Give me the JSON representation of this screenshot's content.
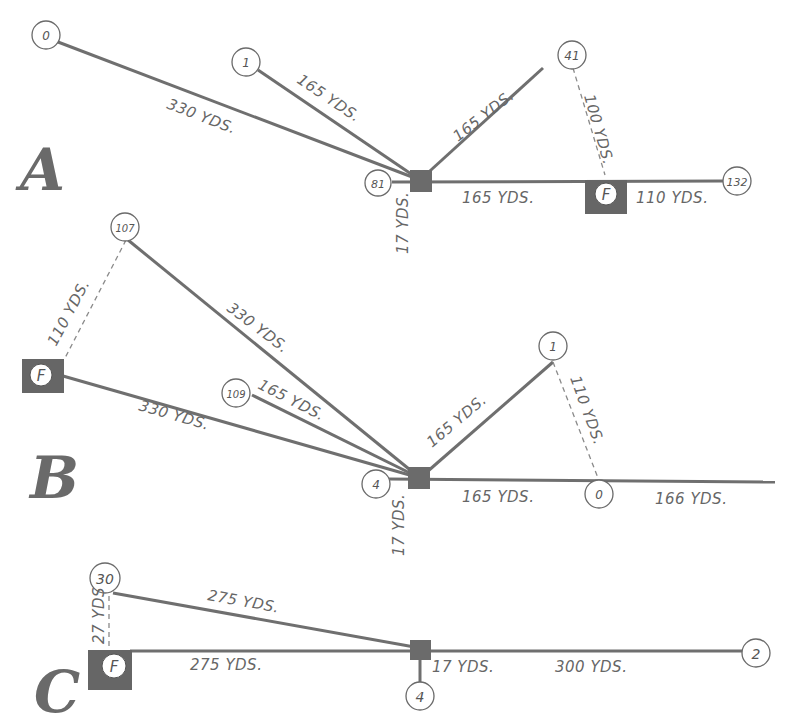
{
  "diagrams": [
    {
      "letter": "A",
      "nodes": {
        "n0": "0",
        "n1": "1",
        "n41": "41",
        "n81": "81",
        "n132": "132",
        "fire": "F"
      },
      "labels": {
        "l330": "330 YDS.",
        "l165a": "165 YDS.",
        "l165b": "165 YDS.",
        "l100": "100 YDS.",
        "l165c": "165 YDS.",
        "l110": "110 YDS.",
        "l17": "17 YDS."
      }
    },
    {
      "letter": "B",
      "nodes": {
        "n107": "107",
        "n109": "109",
        "n1": "1",
        "n4": "4",
        "n0": "0",
        "fire": "F"
      },
      "labels": {
        "l110a": "110 YDS.",
        "l330a": "330 YDS.",
        "l330b": "330 YDS.",
        "l165a": "165 YDS.",
        "l165b": "165 YDS.",
        "l110b": "110 YDS.",
        "l165c": "165 YDS.",
        "l166": "166 YDS.",
        "l17": "17 YDS."
      }
    },
    {
      "letter": "C",
      "nodes": {
        "n30": "30",
        "n4": "4",
        "n2": "2",
        "fire": "F"
      },
      "labels": {
        "l27": "27 YDS",
        "l275a": "275 YDS.",
        "l275b": "275 YDS.",
        "l17": "17 YDS.",
        "l300": "300 YDS."
      }
    }
  ]
}
